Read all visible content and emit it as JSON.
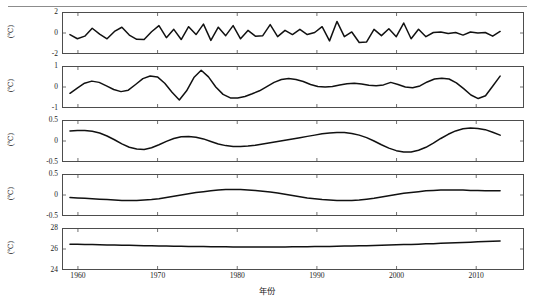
{
  "chart_data": {
    "type": "line",
    "title": "",
    "xlabel": "年份",
    "ylabel": "(℃)",
    "grid": false,
    "legend": null,
    "xlim": [
      1958,
      2016
    ],
    "xticks": [
      1960,
      1970,
      1980,
      1990,
      2000,
      2010
    ],
    "x_start": 1959,
    "x_end": 2013,
    "panels": [
      {
        "name": "IMF1",
        "unit": "(℃)",
        "ylim": [
          -2,
          2
        ],
        "yticks": [
          -2,
          0,
          2
        ],
        "ytick_labels": [
          "-2",
          "0",
          "2"
        ],
        "values": [
          -0.15,
          -0.55,
          -0.3,
          0.45,
          -0.1,
          -0.55,
          0.15,
          0.55,
          -0.2,
          -0.6,
          -0.62,
          0.12,
          0.7,
          -0.45,
          0.35,
          -0.62,
          0.6,
          -0.15,
          0.85,
          -0.7,
          0.55,
          -0.25,
          0.7,
          -0.55,
          0.25,
          -0.3,
          -0.25,
          0.8,
          -0.35,
          0.25,
          -0.15,
          0.35,
          -0.15,
          0.05,
          0.6,
          -0.75,
          1.1,
          -0.35,
          0.1,
          -0.9,
          -0.85,
          0.35,
          -0.25,
          0.4,
          -0.35,
          0.95,
          -0.55,
          0.35,
          -0.35,
          0.05,
          0.1,
          -0.05,
          0.05,
          -0.2,
          0.1,
          0.0,
          0.05,
          -0.3,
          0.15
        ]
      },
      {
        "name": "IMF2",
        "unit": "(℃)",
        "ylim": [
          -1,
          1
        ],
        "yticks": [
          -1,
          0,
          1
        ],
        "ytick_labels": [
          "-1",
          "0",
          "1"
        ],
        "values": [
          -0.3,
          -0.05,
          0.18,
          0.28,
          0.22,
          0.05,
          -0.12,
          -0.22,
          -0.15,
          0.12,
          0.4,
          0.52,
          0.48,
          0.18,
          -0.25,
          -0.62,
          -0.18,
          0.45,
          0.8,
          0.48,
          0.0,
          -0.35,
          -0.52,
          -0.52,
          -0.45,
          -0.32,
          -0.18,
          0.02,
          0.22,
          0.36,
          0.4,
          0.36,
          0.26,
          0.12,
          0.02,
          0.0,
          0.02,
          0.1,
          0.16,
          0.18,
          0.14,
          0.08,
          0.06,
          0.1,
          0.22,
          0.12,
          0.0,
          -0.04,
          0.05,
          0.24,
          0.38,
          0.42,
          0.38,
          0.2,
          -0.08,
          -0.38,
          -0.55,
          -0.42,
          0.05,
          0.52
        ]
      },
      {
        "name": "IMF3",
        "unit": "(℃)",
        "ylim": [
          -0.5,
          0.5
        ],
        "yticks": [
          -0.5,
          0,
          0.5
        ],
        "ytick_labels": [
          "-0.5",
          "0",
          "0.5"
        ],
        "values": [
          0.24,
          0.25,
          0.25,
          0.23,
          0.19,
          0.12,
          0.03,
          -0.07,
          -0.15,
          -0.19,
          -0.2,
          -0.16,
          -0.09,
          -0.01,
          0.06,
          0.1,
          0.11,
          0.09,
          0.05,
          -0.01,
          -0.07,
          -0.11,
          -0.13,
          -0.13,
          -0.12,
          -0.1,
          -0.07,
          -0.04,
          -0.01,
          0.02,
          0.05,
          0.08,
          0.11,
          0.14,
          0.17,
          0.19,
          0.2,
          0.2,
          0.18,
          0.14,
          0.08,
          0.0,
          -0.09,
          -0.17,
          -0.23,
          -0.26,
          -0.26,
          -0.22,
          -0.15,
          -0.05,
          0.06,
          0.16,
          0.24,
          0.29,
          0.31,
          0.3,
          0.27,
          0.21,
          0.14
        ]
      },
      {
        "name": "IMF4",
        "unit": "(℃)",
        "ylim": [
          -0.5,
          0.5
        ],
        "yticks": [
          -0.5,
          0,
          0.5
        ],
        "ytick_labels": [
          "-0.5",
          "0",
          "0.5"
        ],
        "values": [
          -0.06,
          -0.07,
          -0.08,
          -0.09,
          -0.1,
          -0.11,
          -0.12,
          -0.13,
          -0.13,
          -0.13,
          -0.12,
          -0.11,
          -0.09,
          -0.06,
          -0.03,
          0.0,
          0.03,
          0.06,
          0.08,
          0.1,
          0.12,
          0.13,
          0.13,
          0.13,
          0.12,
          0.11,
          0.09,
          0.07,
          0.05,
          0.02,
          -0.01,
          -0.04,
          -0.07,
          -0.09,
          -0.11,
          -0.12,
          -0.13,
          -0.13,
          -0.13,
          -0.12,
          -0.1,
          -0.08,
          -0.05,
          -0.02,
          0.01,
          0.04,
          0.06,
          0.08,
          0.1,
          0.11,
          0.12,
          0.12,
          0.12,
          0.12,
          0.11,
          0.11,
          0.1,
          0.1,
          0.1
        ]
      },
      {
        "name": "RES",
        "unit": "(℃)",
        "ylim": [
          24,
          28
        ],
        "yticks": [
          24,
          26,
          28
        ],
        "ytick_labels": [
          "24",
          "26",
          "28"
        ],
        "values": [
          26.46,
          26.45,
          26.44,
          26.42,
          26.41,
          26.39,
          26.38,
          26.36,
          26.35,
          26.33,
          26.32,
          26.31,
          26.29,
          26.28,
          26.27,
          26.26,
          26.25,
          26.24,
          26.23,
          26.22,
          26.21,
          26.21,
          26.2,
          26.2,
          26.19,
          26.19,
          26.19,
          26.19,
          26.2,
          26.2,
          26.21,
          26.21,
          26.22,
          26.23,
          26.24,
          26.25,
          26.26,
          26.28,
          26.29,
          26.31,
          26.32,
          26.34,
          26.36,
          26.38,
          26.4,
          26.42,
          26.44,
          26.46,
          26.49,
          26.51,
          26.54,
          26.56,
          26.59,
          26.62,
          26.65,
          26.68,
          26.71,
          26.74,
          26.77
        ]
      }
    ]
  }
}
